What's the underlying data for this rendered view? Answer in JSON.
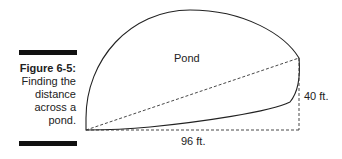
{
  "caption": {
    "figure_label": "Figure 6-5:",
    "text_lines": [
      "Finding the",
      "distance",
      "across a",
      "pond."
    ]
  },
  "diagram": {
    "pond_label": "Pond",
    "horizontal_label": "96 ft.",
    "vertical_label": "40 ft."
  }
}
